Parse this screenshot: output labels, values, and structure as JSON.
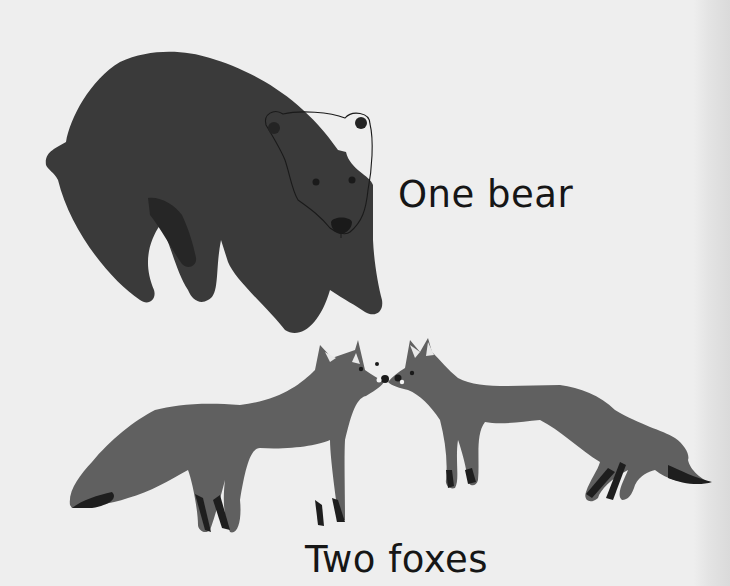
{
  "page": {
    "background": "#eeeeee"
  },
  "sections": [
    {
      "id": "bear",
      "caption": "One bear",
      "illustration": "bear-illustration",
      "color": "#3a3a3a"
    },
    {
      "id": "foxes",
      "caption": "Two foxes",
      "illustration": "two-foxes-illustration",
      "color": "#606060",
      "accent_color": "#1e1e1e"
    }
  ]
}
